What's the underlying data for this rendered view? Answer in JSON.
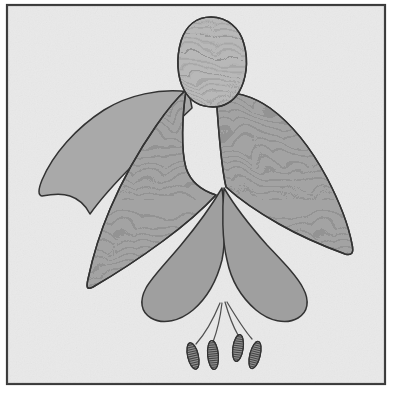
{
  "figure": {
    "style": "grayscale line drawing with squiggle stipple texture",
    "caption": ""
  },
  "canvas": {
    "width": 394,
    "height": 396,
    "outer_background": "#ffffff",
    "plate_background": "#e9e9e9",
    "noise": "fine paper grain"
  },
  "frame": {
    "name": "picture-border",
    "x": 7,
    "y": 5,
    "width": 378,
    "height": 379,
    "stroke": "#3a3a3a",
    "stroke_width": 2.2,
    "fill": "#e9e9e9"
  },
  "palette": {
    "outline": "#2b2b2b",
    "ovary_fill": "#b6b6b6",
    "sepal_textured_fill": "#a0a0a0",
    "sepal_plain_fill": "#a6a6a6",
    "petal_fill": "#9c9c9c",
    "texture_line": "#7d7d7d",
    "anther_fill": "#8d8d8d",
    "anther_stripe": "#3d3d3d",
    "filament_stroke": "#4a4a4a",
    "background": "#e9e9e9"
  },
  "parts": [
    {
      "id": "ovary-bud",
      "label": "Ovary / flower bud",
      "fill": "#b6b6b6",
      "textured": true,
      "path": "M 211 17 C 227 17 240 28 244 44 C 249 62 246 80 239 92 C 233 102 223 107 213 107 C 200 107 190 101 184 90 C 177 77 176 58 181 41 C 186 25 197 17 211 17 Z"
    },
    {
      "id": "sepal-left-plain",
      "label": "Left lateral sepal",
      "fill": "#a6a6a6",
      "textured": false,
      "path": "M 189 92 C 160 88 128 95 104 110 C 76 128 53 154 42 180 C 38 190 38 195 42 196 C 52 194 62 193 70 196 C 79 199 86 206 90 214 C 100 200 116 182 134 164 C 155 143 177 122 192 108 Z"
    },
    {
      "id": "sepal-center-textured",
      "label": "Central sepal mass (textured)",
      "fill": "#a0a0a0",
      "textured": true,
      "path": "M 186 90 C 178 97 167 110 156 126 C 140 149 122 181 110 209 C 99 235 92 260 88 279 C 86 288 87 290 93 287 C 112 276 140 258 163 241 C 186 224 204 208 216 195 C 200 190 190 180 186 168 C 181 150 182 118 186 90 Z"
    },
    {
      "id": "sepal-right-textured",
      "label": "Right lateral sepal (textured)",
      "fill": "#a0a0a0",
      "textured": true,
      "path": "M 216 93 C 232 90 253 96 270 108 C 292 124 312 150 327 178 C 340 203 349 228 352 244 C 354 253 352 256 345 254 C 326 247 300 236 279 224 C 256 211 238 198 226 187 C 222 170 219 140 216 93 Z"
    },
    {
      "id": "petal-corolla-left",
      "label": "Left corolla petal",
      "fill": "#9c9c9c",
      "textured": false,
      "path": "M 222 188 C 212 205 196 227 181 245 C 166 263 152 277 146 288 C 139 301 141 312 151 318 C 163 325 180 321 193 310 C 207 298 217 280 222 260 C 226 240 225 210 222 188 Z"
    },
    {
      "id": "petal-corolla-right",
      "label": "Right corolla petal",
      "fill": "#9c9c9c",
      "textured": false,
      "path": "M 224 188 C 234 205 251 227 267 245 C 283 262 297 276 303 288 C 310 301 308 312 298 318 C 286 325 269 321 256 310 C 242 298 231 280 227 260 C 222 240 222 210 224 188 Z"
    },
    {
      "id": "style-and-stamens",
      "label": "Style and four stamens",
      "filaments": [
        {
          "id": "filament-1",
          "path": "M 220 303 C 213 320 204 335 196 344"
        },
        {
          "id": "filament-2",
          "path": "M 222 303 C 220 320 216 334 213 342"
        },
        {
          "id": "filament-3",
          "path": "M 225 302 C 229 316 234 328 238 335"
        },
        {
          "id": "filament-4",
          "path": "M 227 302 C 236 317 245 331 252 339"
        }
      ],
      "anthers": [
        {
          "id": "anther-1",
          "cx": 193,
          "cy": 356,
          "rx": 5.4,
          "ry": 13.5,
          "rotate": -13,
          "stripes": 11
        },
        {
          "id": "anther-2",
          "cx": 213,
          "cy": 355,
          "rx": 5.4,
          "ry": 14.5,
          "rotate": -5,
          "stripes": 12
        },
        {
          "id": "anther-3",
          "cx": 238,
          "cy": 348,
          "rx": 5.2,
          "ry": 13.5,
          "rotate": 8,
          "stripes": 11
        },
        {
          "id": "anther-4",
          "cx": 255,
          "cy": 355,
          "rx": 5.2,
          "ry": 14.0,
          "rotate": 14,
          "stripes": 12
        }
      ]
    }
  ]
}
